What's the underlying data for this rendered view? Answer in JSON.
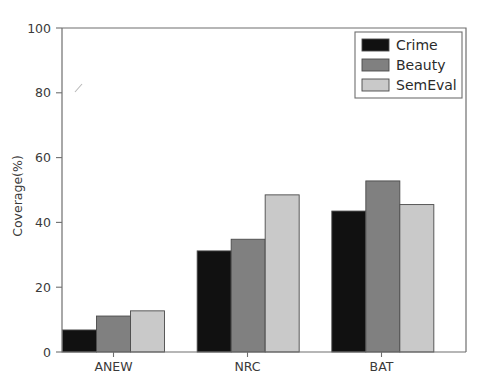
{
  "chart_data": {
    "type": "bar",
    "title": "",
    "xlabel": "",
    "ylabel": "Coverage(%)",
    "categories": [
      "ANEW",
      "NRC",
      "BAT"
    ],
    "series": [
      {
        "name": "Crime",
        "values": [
          6.8,
          31.2,
          43.5
        ],
        "color": "#111111"
      },
      {
        "name": "Beauty",
        "values": [
          11.1,
          34.8,
          52.8
        ],
        "color": "#808080"
      },
      {
        "name": "SemEval",
        "values": [
          12.7,
          48.5,
          45.5
        ],
        "color": "#c9c9c9"
      }
    ],
    "ylim": [
      0,
      100
    ],
    "yticks": [
      "0",
      "20",
      "40",
      "60",
      "80",
      "100"
    ],
    "ytick_values": [
      0,
      20,
      40,
      60,
      80,
      100
    ],
    "xlim": [
      0,
      3
    ],
    "grid": "off",
    "legend_position": "upper right"
  },
  "legend": {
    "entries": [
      {
        "label": "Crime"
      },
      {
        "label": "Beauty"
      },
      {
        "label": "SemEval"
      }
    ]
  },
  "axes": {
    "y_title": "Coverage(%)",
    "y_ticks": [
      "0",
      "20",
      "40",
      "60",
      "80",
      "100"
    ],
    "x_ticks": [
      "ANEW",
      "NRC",
      "BAT"
    ]
  }
}
